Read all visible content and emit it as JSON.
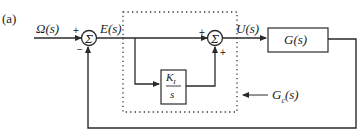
{
  "figure_label": "(a)",
  "signals": {
    "input": "Ω(s)",
    "error": "E(s)",
    "control": "U(s)"
  },
  "blocks": {
    "plant": "G(s)",
    "integrator_num": "K",
    "integrator_sub": "I",
    "integrator_den": "s",
    "controller_label": "G",
    "controller_sub": "c",
    "controller_tail": "(s)"
  },
  "summing_junctions": [
    {
      "id": "sum1",
      "symbol": "Σ",
      "signs": {
        "left": "+",
        "bottom": "−"
      }
    },
    {
      "id": "sum2",
      "symbol": "Σ",
      "signs": {
        "left": "+",
        "bottom": "+"
      }
    }
  ],
  "colors": {
    "line": "#2a2a2a",
    "background": "#ffffff"
  }
}
